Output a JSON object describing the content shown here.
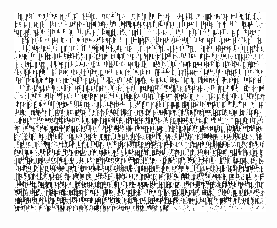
{
  "document": {
    "kind": "scanned-page-fragment",
    "legible_text": "",
    "ocr_recoverable": "false",
    "condition": "severely degraded / noise corrupted",
    "canvas": {
      "width_px": 277,
      "height_px": 228
    },
    "paper": {
      "background_color": "#fdfdfd",
      "ink_color": "#101010"
    },
    "content_region": {
      "left_px": 14,
      "top_px": 12,
      "width_px": 252,
      "height_px": 200,
      "right_edge": "ragged",
      "bottom_edge": "ragged"
    },
    "text_block": {
      "line_count": 25,
      "line_pitch_px": 8,
      "stroke_orientation": "vertical-dominant",
      "alignment": "justified"
    },
    "density_bands": [
      {
        "name": "upper",
        "top_px": 12,
        "height_px": 52,
        "coverage": 0.34,
        "description": "lightest and sparsest; broken strokes with wide white gaps"
      },
      {
        "name": "upper-middle",
        "top_px": 64,
        "height_px": 48,
        "coverage": 0.46,
        "description": "moderate density, emerging horizontal line banding"
      },
      {
        "name": "lower-middle",
        "top_px": 112,
        "height_px": 52,
        "coverage": 0.58,
        "description": "dense, pronounced vertical strokes and visible ruled lines"
      },
      {
        "name": "lower",
        "top_px": 164,
        "height_px": 48,
        "coverage": 0.66,
        "description": "darkest; tightly packed rows with heavy ink bleed"
      }
    ]
  }
}
